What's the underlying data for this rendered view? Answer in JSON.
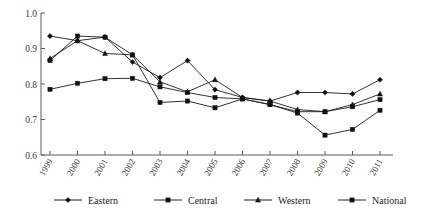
{
  "chart_data": {
    "type": "line",
    "title": "",
    "subtitle": "",
    "xlabel": "",
    "ylabel": "",
    "grid": false,
    "legend_position": "bottom",
    "ylim": [
      0.6,
      1.0
    ],
    "ytick_labels": [
      "1.0",
      "0.9",
      "0.8",
      "0.7",
      "0.6"
    ],
    "ytick_values": [
      1.0,
      0.9,
      0.8,
      0.7,
      0.6
    ],
    "categories": [
      "1999",
      "2000",
      "2001",
      "2002",
      "2003",
      "2004",
      "2005",
      "2006",
      "2007",
      "2008",
      "2009",
      "2010",
      "2011"
    ],
    "series": [
      {
        "name": "Eastern",
        "marker": "diamond",
        "color": "#111111",
        "values": [
          0.935,
          0.922,
          0.932,
          0.862,
          0.818,
          0.866,
          0.784,
          0.762,
          0.752,
          0.776,
          0.776,
          0.772,
          0.812
        ]
      },
      {
        "name": "Central",
        "marker": "square",
        "color": "#111111",
        "values": [
          0.866,
          0.935,
          0.932,
          0.882,
          0.748,
          0.752,
          0.733,
          0.758,
          0.742,
          0.718,
          0.656,
          0.672,
          0.726
        ]
      },
      {
        "name": "Western",
        "marker": "triangle",
        "color": "#111111",
        "values": [
          0.872,
          0.922,
          0.886,
          0.882,
          0.806,
          0.778,
          0.812,
          0.762,
          0.752,
          0.728,
          0.722,
          0.742,
          0.772
        ]
      },
      {
        "name": "National",
        "marker": "square",
        "color": "#111111",
        "values": [
          0.785,
          0.802,
          0.815,
          0.816,
          0.792,
          0.776,
          0.762,
          0.758,
          0.742,
          0.722,
          0.722,
          0.736,
          0.756
        ]
      }
    ]
  },
  "legend": {
    "items": [
      {
        "label": "Eastern"
      },
      {
        "label": "Central"
      },
      {
        "label": "Western"
      },
      {
        "label": "National"
      }
    ]
  }
}
